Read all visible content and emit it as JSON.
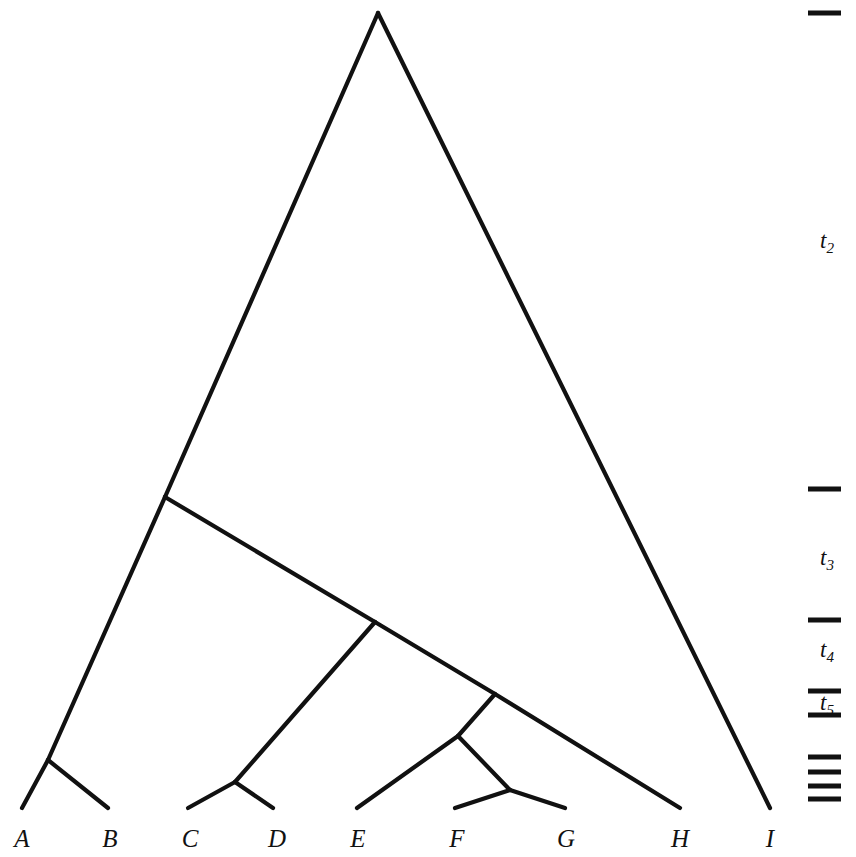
{
  "figure": {
    "kind": "phylogenetic-tree",
    "background_color": "#ffffff",
    "line_color": "#111111",
    "width": 856,
    "height": 857
  },
  "tips": [
    {
      "label": "A",
      "x": 22,
      "y": 808,
      "label_x": 22,
      "label_y": 826
    },
    {
      "label": "B",
      "x": 108,
      "y": 808,
      "label_x": 110,
      "label_y": 826
    },
    {
      "label": "C",
      "x": 188,
      "y": 808,
      "label_x": 190,
      "label_y": 826
    },
    {
      "label": "D",
      "x": 273,
      "y": 808,
      "label_x": 277,
      "label_y": 826
    },
    {
      "label": "E",
      "x": 357,
      "y": 808,
      "label_x": 358,
      "label_y": 826
    },
    {
      "label": "F",
      "x": 455,
      "y": 808,
      "label_x": 457,
      "label_y": 826
    },
    {
      "label": "G",
      "x": 565,
      "y": 808,
      "label_x": 566,
      "label_y": 826
    },
    {
      "label": "H",
      "x": 680,
      "y": 808,
      "label_x": 680,
      "label_y": 826
    },
    {
      "label": "I",
      "x": 770,
      "y": 808,
      "label_x": 770,
      "label_y": 826
    }
  ],
  "nodes": [
    {
      "name": "root",
      "x": 378,
      "y": 13
    },
    {
      "name": "node-t2",
      "x": 165,
      "y": 497
    },
    {
      "name": "node-t3",
      "x": 375,
      "y": 622
    },
    {
      "name": "node-t4",
      "x": 495,
      "y": 694
    },
    {
      "name": "node-t5",
      "x": 458,
      "y": 736
    },
    {
      "name": "node-ab",
      "x": 48,
      "y": 760
    },
    {
      "name": "node-cd",
      "x": 235,
      "y": 782
    },
    {
      "name": "node-fg",
      "x": 510,
      "y": 790
    }
  ],
  "branches": [
    {
      "name": "root-to-left",
      "x1": 378,
      "y1": 13,
      "x2": 165,
      "y2": 497
    },
    {
      "name": "root-to-i",
      "x1": 378,
      "y1": 13,
      "x2": 770,
      "y2": 808
    },
    {
      "name": "t2-to-ab",
      "x1": 165,
      "y1": 497,
      "x2": 48,
      "y2": 760
    },
    {
      "name": "t2-to-t3",
      "x1": 165,
      "y1": 497,
      "x2": 375,
      "y2": 622
    },
    {
      "name": "ab-to-a",
      "x1": 48,
      "y1": 760,
      "x2": 22,
      "y2": 808
    },
    {
      "name": "ab-to-b",
      "x1": 48,
      "y1": 760,
      "x2": 108,
      "y2": 808
    },
    {
      "name": "t3-to-cd",
      "x1": 375,
      "y1": 622,
      "x2": 235,
      "y2": 782
    },
    {
      "name": "t3-to-t4",
      "x1": 375,
      "y1": 622,
      "x2": 495,
      "y2": 694
    },
    {
      "name": "cd-to-c",
      "x1": 235,
      "y1": 782,
      "x2": 188,
      "y2": 808
    },
    {
      "name": "cd-to-d",
      "x1": 235,
      "y1": 782,
      "x2": 273,
      "y2": 808
    },
    {
      "name": "t4-to-t5",
      "x1": 495,
      "y1": 694,
      "x2": 458,
      "y2": 736
    },
    {
      "name": "t4-to-h",
      "x1": 495,
      "y1": 694,
      "x2": 680,
      "y2": 808
    },
    {
      "name": "t5-to-e",
      "x1": 458,
      "y1": 736,
      "x2": 357,
      "y2": 808
    },
    {
      "name": "t5-to-fg",
      "x1": 458,
      "y1": 736,
      "x2": 510,
      "y2": 790
    },
    {
      "name": "fg-to-f",
      "x1": 510,
      "y1": 790,
      "x2": 455,
      "y2": 808
    },
    {
      "name": "fg-to-g",
      "x1": 510,
      "y1": 790,
      "x2": 565,
      "y2": 808
    }
  ],
  "time_scale": {
    "tick_x_start": 808,
    "tick_x_end": 841,
    "ticks": [
      {
        "name": "tick-t1",
        "y": 13
      },
      {
        "name": "tick-t2",
        "y": 489
      },
      {
        "name": "tick-t3",
        "y": 620
      },
      {
        "name": "tick-t4",
        "y": 691
      },
      {
        "name": "tick-t5",
        "y": 715
      },
      {
        "name": "tick-t6",
        "y": 757
      },
      {
        "name": "tick-t7",
        "y": 772
      },
      {
        "name": "tick-t8",
        "y": 786
      },
      {
        "name": "tick-t9",
        "y": 799
      }
    ],
    "labels": [
      {
        "name": "label-t2",
        "base": "t",
        "sub": "2",
        "x": 827,
        "y": 243
      },
      {
        "name": "label-t3",
        "base": "t",
        "sub": "3",
        "x": 827,
        "y": 560
      },
      {
        "name": "label-t4",
        "base": "t",
        "sub": "4",
        "x": 827,
        "y": 652
      },
      {
        "name": "label-t5",
        "base": "t",
        "sub": "5",
        "x": 827,
        "y": 705
      }
    ]
  }
}
